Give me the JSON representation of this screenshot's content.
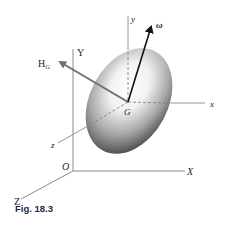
{
  "figure": {
    "caption": "Fig. 18.3",
    "labels": {
      "Y_axis": "Y",
      "X_axis": "X",
      "Z_axis": "Z",
      "origin": "O",
      "y_axis": "y",
      "x_axis": "x",
      "z_axis": "z",
      "center": "G",
      "angular_momentum": "H",
      "angular_momentum_sub": "G",
      "angular_velocity": "ω"
    },
    "colors": {
      "axis_line": "#8a8a8a",
      "arrow_H": "#6f6f6f",
      "arrow_omega": "#111111",
      "body_dark": "#4a4a4a",
      "body_light": "#ffffff",
      "caption": "#1f2a44"
    }
  }
}
